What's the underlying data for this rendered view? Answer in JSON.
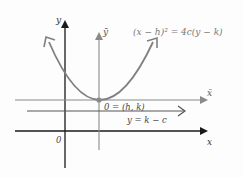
{
  "diagram": {
    "equation": "(x − h)² = 4c(y − k)",
    "axis_y": "y",
    "axis_x": "x",
    "axis_ybar": "ȳ",
    "axis_xbar": "x̄",
    "vertex_label": "0 = (h, k)",
    "directrix_label": "y = k − c",
    "origin_label": "0",
    "colors": {
      "parabola": "#808080",
      "ink": "#1a1a1a",
      "translated_axes": "#8a8a8a",
      "text": "#666666"
    }
  }
}
